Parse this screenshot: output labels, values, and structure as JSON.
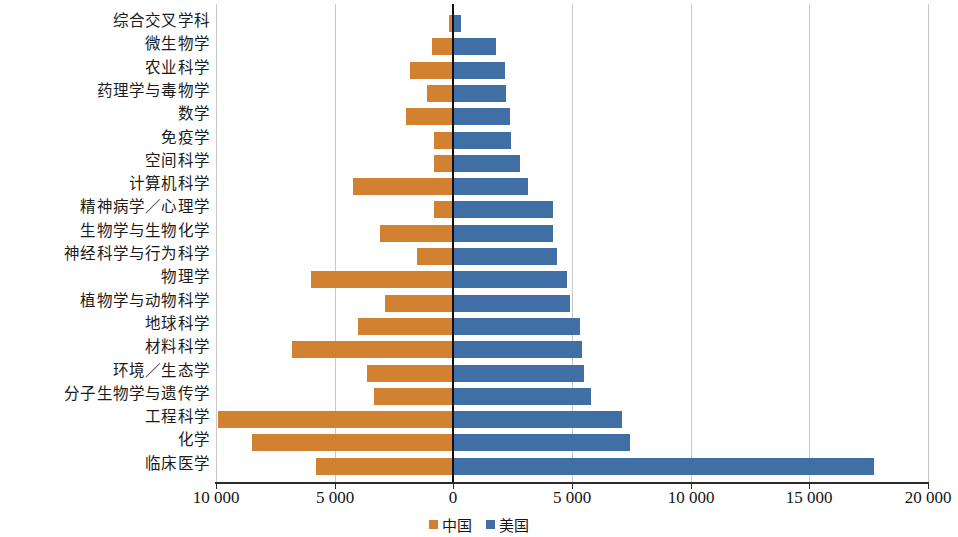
{
  "chart_data": {
    "type": "bar",
    "orientation": "horizontal",
    "style": "diverging-bidirectional",
    "title": "",
    "subtitle": "",
    "xlabel": "",
    "ylabel": "",
    "xlim": [
      -10000,
      20000
    ],
    "xticks": [
      -10000,
      -5000,
      0,
      5000,
      10000,
      15000,
      20000
    ],
    "xtick_labels": [
      "10 000",
      "5 000",
      "0",
      "5 000",
      "10 000",
      "15 000",
      "20 000"
    ],
    "grid": true,
    "grid_axis": "x",
    "legend_position": "bottom-center",
    "categories": [
      "综合交叉学科",
      "微生物学",
      "农业科学",
      "药理学与毒物学",
      "数学",
      "免疫学",
      "空间科学",
      "计算机科学",
      "精神病学／心理学",
      "生物学与生物化学",
      "神经科学与行为科学",
      "物理学",
      "植物学与动物科学",
      "地球科学",
      "材料科学",
      "环境／生态学",
      "分子生物学与遗传学",
      "工程科学",
      "化学",
      "临床医学"
    ],
    "series": [
      {
        "name": "中国",
        "color": "#d1812f",
        "direction": "left",
        "values": [
          170,
          880,
          1840,
          1130,
          2010,
          800,
          800,
          4230,
          800,
          3100,
          1550,
          5980,
          2890,
          4020,
          6780,
          3640,
          3350,
          9920,
          8490,
          5770
        ]
      },
      {
        "name": "美国",
        "color": "#3f6fa4",
        "direction": "right",
        "values": [
          340,
          1800,
          2180,
          2220,
          2390,
          2430,
          2800,
          3140,
          4190,
          4190,
          4350,
          4810,
          4900,
          5320,
          5440,
          5520,
          5820,
          7110,
          7450,
          17740
        ]
      }
    ]
  },
  "legend": {
    "items": [
      {
        "label": "中国",
        "color": "#d1812f"
      },
      {
        "label": "美国",
        "color": "#3f6fa4"
      }
    ]
  }
}
